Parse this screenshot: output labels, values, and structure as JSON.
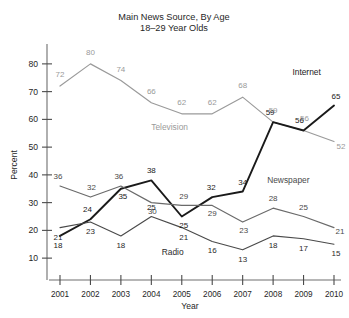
{
  "chart_data": {
    "type": "line",
    "title": "Main News Source, By Age",
    "subtitle": "18–29 Year Olds",
    "xlabel": "Year",
    "ylabel": "Percent",
    "categories": [
      "2001",
      "2002",
      "2003",
      "2004",
      "2005",
      "2006",
      "2007",
      "2008",
      "2009",
      "2010"
    ],
    "x": [
      2001,
      2002,
      2003,
      2004,
      2005,
      2006,
      2007,
      2008,
      2009,
      2010
    ],
    "ylim": [
      5,
      85
    ],
    "yticks": [
      10,
      20,
      30,
      40,
      50,
      60,
      70,
      80
    ],
    "grid": false,
    "legend_position": "inline-annotations",
    "series": [
      {
        "name": "Television",
        "color": "#9a9a9a",
        "values": [
          72,
          80,
          74,
          66,
          62,
          62,
          68,
          59,
          56,
          52
        ],
        "label_color": "#9a9a9a"
      },
      {
        "name": "Internet",
        "color": "#1a1a1a",
        "values": [
          18,
          24,
          35,
          38,
          25,
          32,
          34,
          59,
          56,
          65
        ],
        "label_color": "#1a1a1a"
      },
      {
        "name": "Newspaper",
        "color": "#6a6a6a",
        "values": [
          36,
          32,
          36,
          30,
          29,
          29,
          23,
          28,
          25,
          21
        ],
        "label_color": "#4a4a4a"
      },
      {
        "name": "Radio",
        "color": "#4a4a4a",
        "values": [
          21,
          23,
          18,
          25,
          21,
          16,
          13,
          18,
          17,
          15
        ],
        "label_color": "#2a2a2a"
      }
    ],
    "annotations": [
      {
        "text": "Television",
        "series": "Television",
        "x": 2004.6,
        "y": 56
      },
      {
        "text": "Internet",
        "series": "Internet",
        "x": 2009.1,
        "y": 76
      },
      {
        "text": "Newspaper",
        "series": "Newspaper",
        "x": 2008.5,
        "y": 37
      },
      {
        "text": "Radio",
        "series": "Radio",
        "x": 2004.7,
        "y": 11
      }
    ]
  }
}
